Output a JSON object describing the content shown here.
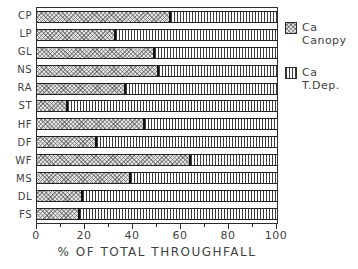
{
  "chart_data": {
    "type": "bar",
    "orientation": "horizontal",
    "stacked": true,
    "title": "",
    "xlabel": "% OF TOTAL THROUGHFALL",
    "ylabel": "",
    "xlim": [
      0,
      100
    ],
    "xticks": [
      0,
      20,
      40,
      60,
      80,
      100
    ],
    "minor_xticks": [
      10,
      30,
      50,
      70,
      90
    ],
    "grid": false,
    "categories": [
      "CP",
      "LP",
      "GL",
      "NS",
      "RA",
      "ST",
      "HF",
      "DF",
      "WF",
      "MS",
      "DL",
      "FS"
    ],
    "series": [
      {
        "name": "Ca Canopy",
        "pattern": "diagonal-hatch",
        "values": [
          56,
          33,
          49,
          51,
          37,
          13,
          45,
          25,
          64,
          39,
          19,
          18
        ]
      },
      {
        "name": "Ca T.Dep.",
        "pattern": "vertical-lines",
        "values": [
          44,
          67,
          51,
          49,
          63,
          87,
          55,
          75,
          36,
          61,
          81,
          82
        ]
      }
    ],
    "legend": {
      "position": "right-top",
      "entries": [
        {
          "line1": "Ca",
          "line2": "Canopy"
        },
        {
          "line1": "Ca",
          "line2": "T.Dep."
        }
      ]
    }
  },
  "colors": {
    "background": "#ffffff",
    "axis": "#2e2e2e",
    "text": "#3f3f3f",
    "bar_border": "#222222",
    "canopy_fill": "#e2e2e2",
    "tdep_fill": "#ffffff"
  }
}
